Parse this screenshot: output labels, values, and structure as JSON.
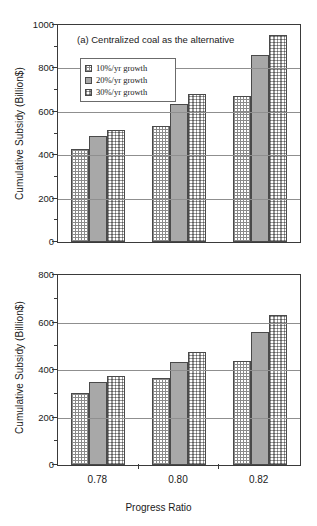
{
  "chart_data": [
    {
      "type": "bar",
      "panel": "a",
      "title": "(a) Centralized coal as the alternative",
      "categories": [
        "0.78",
        "0.80",
        "0.82"
      ],
      "series": [
        {
          "name": "10%/yr growth",
          "values": [
            430,
            535,
            675
          ],
          "pattern": "grid-hatch"
        },
        {
          "name": "20%/yr growth",
          "values": [
            490,
            635,
            860
          ],
          "pattern": "solid-gray"
        },
        {
          "name": "30%/yr growth",
          "values": [
            515,
            680,
            955
          ],
          "pattern": "dotted-brick"
        }
      ],
      "xlabel": "",
      "ylabel": "Cumulative Subsidy (Billion$)",
      "ylim": [
        0,
        1000
      ],
      "yticks": [
        0,
        200,
        400,
        600,
        800,
        1000
      ],
      "yminor_step": 100,
      "grid": true,
      "legend_position": "upper-left-inside",
      "xtick_labels_shown": false
    },
    {
      "type": "bar",
      "panel": "b",
      "title": "(b) Decentralized natural gas as the alternative",
      "categories": [
        "0.78",
        "0.80",
        "0.82"
      ],
      "series": [
        {
          "name": "10%/yr growth",
          "values": [
            305,
            365,
            440
          ],
          "pattern": "grid-hatch"
        },
        {
          "name": "20%/yr growth",
          "values": [
            350,
            435,
            560
          ],
          "pattern": "solid-gray"
        },
        {
          "name": "30%/yr growth",
          "values": [
            375,
            475,
            630
          ],
          "pattern": "dotted-brick"
        }
      ],
      "xlabel": "Progress Ratio",
      "ylabel": "Cumulative Subsidy (Billion$)",
      "ylim": [
        0,
        800
      ],
      "yticks": [
        0,
        200,
        400,
        600,
        800
      ],
      "yminor_step": 100,
      "grid": true,
      "legend_position": "upper-left-inside",
      "xtick_labels_shown": true
    }
  ],
  "colors": {
    "series1": "#ffffff",
    "series2": "#a8a8a8",
    "series3": "#ffffff",
    "axis": "#3a3a3a",
    "grid": "#8f8f8f",
    "background": "#ffffff"
  }
}
